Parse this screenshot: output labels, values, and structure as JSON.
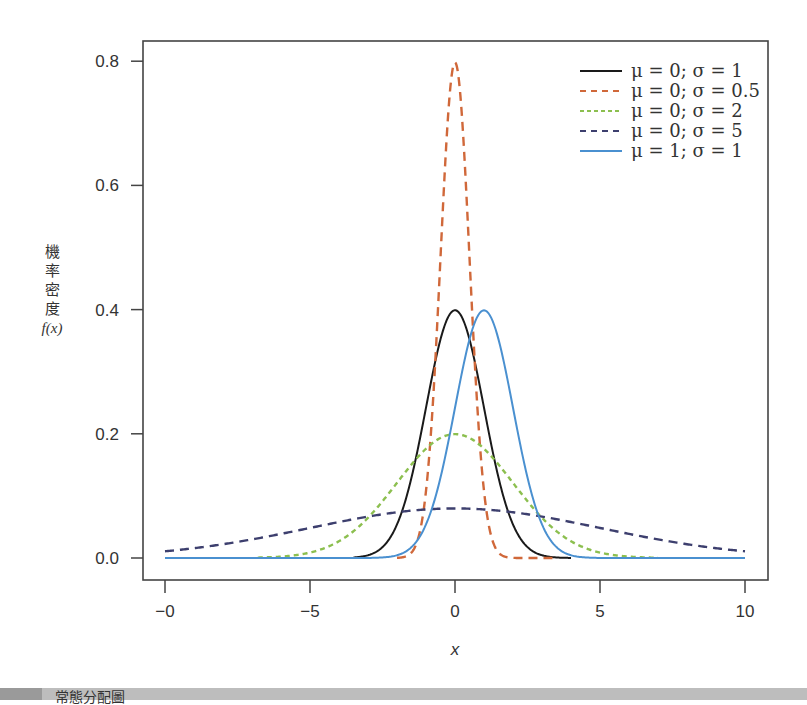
{
  "chart_data": {
    "type": "line",
    "title": "",
    "xlabel": "x",
    "ylabel": "機率密度 f(x)",
    "ylabel_lines": [
      "機",
      "率",
      "密",
      "度",
      "f(x)"
    ],
    "xlim": [
      -10.5,
      11
    ],
    "ylim": [
      -0.035,
      0.83
    ],
    "xticks": [
      -10,
      -5,
      0,
      5,
      10
    ],
    "xtick_labels": [
      "−0",
      "−5",
      "0",
      "5",
      "10"
    ],
    "yticks": [
      0.0,
      0.2,
      0.4,
      0.6,
      0.8
    ],
    "ytick_labels": [
      "0.0",
      "0.2",
      "0.4",
      "0.6",
      "0.8"
    ],
    "grid": false,
    "legend_position": "upper right",
    "series": [
      {
        "name": "μ = 0; σ = 1",
        "mu": 0,
        "sigma": 1,
        "x_range": [
          -3.5,
          4
        ],
        "peak": 0.399,
        "color": "#1a1a1a",
        "dash": "solid"
      },
      {
        "name": "μ = 0; σ = 0.5",
        "mu": 0,
        "sigma": 0.5,
        "x_range": [
          -2,
          3.5
        ],
        "peak": 0.798,
        "color": "#d0683a",
        "dash": "dashed"
      },
      {
        "name": "μ = 0; σ = 2",
        "mu": 0,
        "sigma": 2,
        "x_range": [
          -6.8,
          7
        ],
        "peak": 0.199,
        "color": "#8cbf4f",
        "dash": "dashed-fine"
      },
      {
        "name": "μ = 0; σ = 5",
        "mu": 0,
        "sigma": 5,
        "x_range": [
          -10,
          10
        ],
        "peak": 0.08,
        "color": "#3d3f6e",
        "dash": "dashed"
      },
      {
        "name": "μ = 1; σ = 1",
        "mu": 1,
        "sigma": 1,
        "x_range": [
          -10,
          10
        ],
        "peak": 0.399,
        "color": "#4a90d0",
        "dash": "solid"
      }
    ]
  },
  "footer": {
    "caption": "常態分配圖"
  }
}
